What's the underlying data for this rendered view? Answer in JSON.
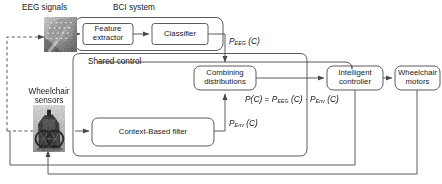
{
  "diagram": {
    "stroke_color": "#4a4a4a",
    "text_color": "#1a1a1a",
    "background": "#ffffff",
    "group_labels": {
      "bci_system": "BCI system",
      "shared_control": "Shared control"
    },
    "input_labels": {
      "eeg_signals": "EEG signals",
      "wheelchair_sensors": "Wheelchair sensors",
      "wheelchair_sensors_line1": "Wheelchair",
      "wheelchair_sensors_line2": "sensors"
    },
    "blocks": [
      {
        "id": "feature-extractor",
        "line1": "Feature",
        "line2": "extractor"
      },
      {
        "id": "classifier",
        "line1": "Classifier",
        "line2": ""
      },
      {
        "id": "combining-distributions",
        "line1": "Combining",
        "line2": "distributions"
      },
      {
        "id": "context-based-filter",
        "line1": "Context-Based filter",
        "line2": ""
      },
      {
        "id": "intelligent-controller",
        "line1": "Intelligent",
        "line2": "controller"
      },
      {
        "id": "wheelchair-motors",
        "line1": "Wheelchair",
        "line2": "motors"
      }
    ],
    "signals": {
      "p_eeg": {
        "base": "P",
        "sub": "EEG",
        "arg": "(C)"
      },
      "p_env": {
        "base": "P",
        "sub": "Env",
        "arg": "(C)"
      },
      "formula": {
        "lhs": "P(C)",
        "equals": "=",
        "term1_base": "P",
        "term1_sub": "EEG",
        "term1_arg": "(C)",
        "operator": "·",
        "term2_base": "P",
        "term2_sub": "Env",
        "term2_arg": "(C)"
      }
    },
    "images": {
      "eeg_cap": "eeg-cap-photo",
      "wheelchair": "wheelchair-photo"
    }
  }
}
